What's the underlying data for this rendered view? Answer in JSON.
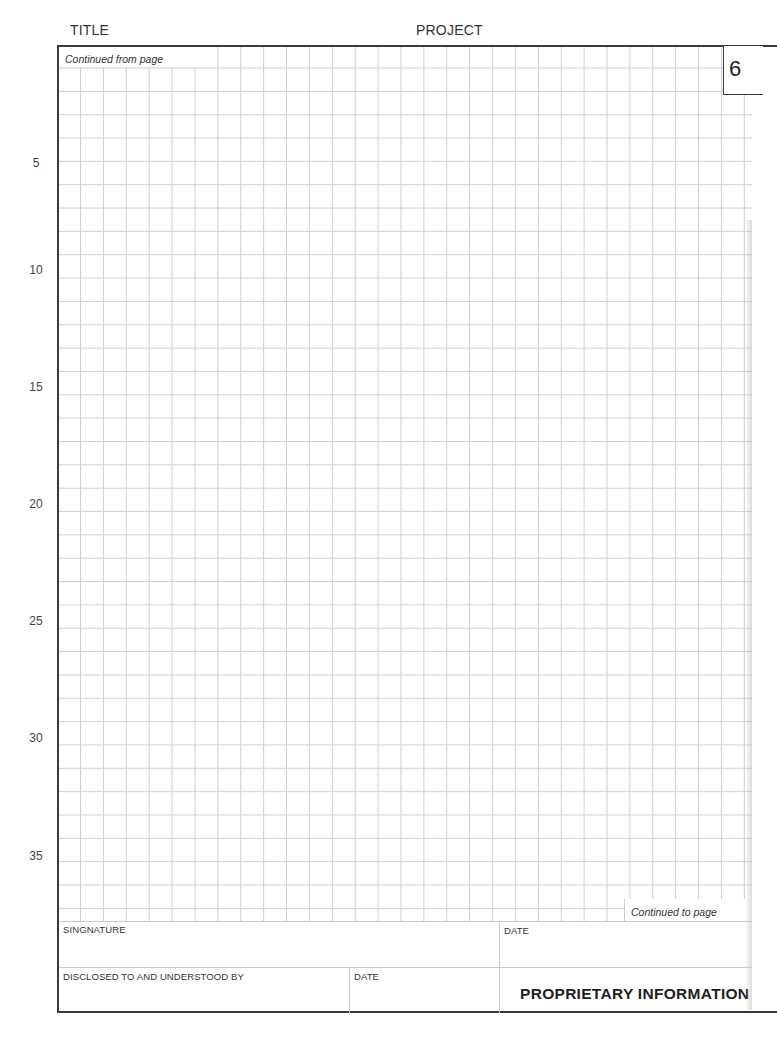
{
  "header": {
    "title_label": "TITLE",
    "project_label": "PROJECT"
  },
  "page": {
    "number": "6",
    "continued_from_label": "Continued from page",
    "continued_to_label": "Continued to page"
  },
  "row_numbers": [
    "5",
    "10",
    "15",
    "20",
    "25",
    "30",
    "35"
  ],
  "footer": {
    "signature_label": "SINGNATURE",
    "signature_date_label": "DATE",
    "disclosed_label": "DISCLOSED TO AND UNDERSTOOD BY",
    "disclosed_date_label": "DATE",
    "proprietary_label": "PROPRIETARY INFORMATION"
  },
  "colors": {
    "frame": "#3a3a3a",
    "grid_line": "#cfcfcf",
    "text": "#2b2b2b"
  }
}
